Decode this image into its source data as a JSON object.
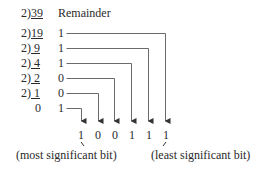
{
  "header": {
    "remainder_label": "Remainder"
  },
  "divisions": [
    {
      "divisor": "2",
      "dividend": "39",
      "remainder": null
    },
    {
      "divisor": "2",
      "dividend": "19",
      "remainder": "1"
    },
    {
      "divisor": "2",
      "dividend": " 9",
      "remainder": "1"
    },
    {
      "divisor": "2",
      "dividend": " 4",
      "remainder": "1"
    },
    {
      "divisor": "2",
      "dividend": " 2",
      "remainder": "0"
    },
    {
      "divisor": "2",
      "dividend": " 1",
      "remainder": "0"
    },
    {
      "divisor": "",
      "dividend": "0",
      "remainder": "1"
    }
  ],
  "result_bits": [
    "1",
    "0",
    "0",
    "1",
    "1",
    "1"
  ],
  "labels": {
    "msb": "(most significant bit)",
    "lsb": "(least significant bit)"
  },
  "colors": {
    "text": "#2a2a2a",
    "line": "#555555"
  }
}
